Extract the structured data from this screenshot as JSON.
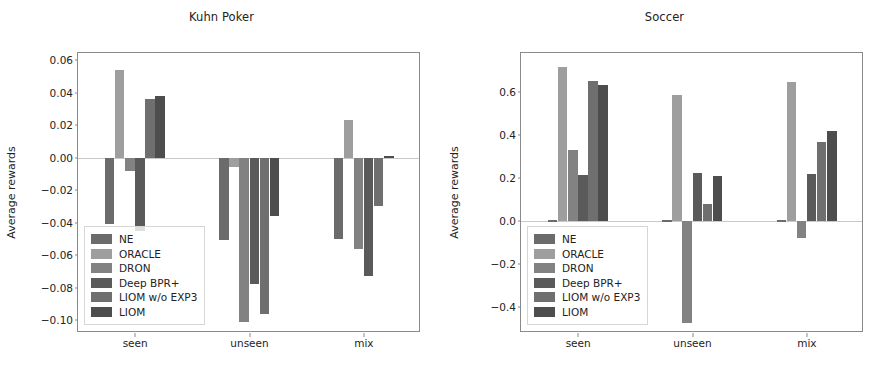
{
  "figure": {
    "panels": [
      "kuhn_poker",
      "soccer"
    ]
  },
  "series_colors": {
    "NE": "#6b6b6b",
    "ORACLE": "#9e9e9e",
    "DRON": "#828282",
    "Deep BPR+": "#5a5a5a",
    "LIOM w/o EXP3": "#6f6f6f",
    "LIOM": "#4d4d4d"
  },
  "legend": {
    "entries": [
      {
        "label": "NE",
        "color": "#6b6b6b"
      },
      {
        "label": "ORACLE",
        "color": "#9e9e9e"
      },
      {
        "label": "DRON",
        "color": "#828282"
      },
      {
        "label": "Deep BPR+",
        "color": "#5a5a5a"
      },
      {
        "label": "LIOM w/o EXP3",
        "color": "#6f6f6f"
      },
      {
        "label": "LIOM",
        "color": "#4d4d4d"
      }
    ]
  },
  "chart_data": [
    {
      "id": "kuhn_poker",
      "type": "bar",
      "title": "Kuhn Poker",
      "xlabel": "",
      "ylabel": "Average rewards",
      "categories": [
        "seen",
        "unseen",
        "mix"
      ],
      "ylim": [
        -0.108,
        0.0645
      ],
      "yticks": [
        0.06,
        0.04,
        0.02,
        0.0,
        -0.02,
        -0.04,
        -0.06,
        -0.08,
        -0.1
      ],
      "ytick_labels": [
        "0.06",
        "0.04",
        "0.02",
        "0.00",
        "−0.02",
        "−0.04",
        "−0.06",
        "−0.08",
        "−0.10"
      ],
      "grid": false,
      "legend_position": "lower left",
      "series": [
        {
          "name": "NE",
          "values": [
            -0.041,
            -0.051,
            -0.05
          ]
        },
        {
          "name": "ORACLE",
          "values": [
            0.054,
            -0.006,
            0.023
          ]
        },
        {
          "name": "DRON",
          "values": [
            -0.008,
            -0.101,
            -0.056
          ]
        },
        {
          "name": "Deep BPR+",
          "values": [
            -0.045,
            -0.078,
            -0.073
          ]
        },
        {
          "name": "LIOM w/o EXP3",
          "values": [
            0.036,
            -0.096,
            -0.03
          ]
        },
        {
          "name": "LIOM",
          "values": [
            0.038,
            -0.036,
            0.0008
          ]
        }
      ]
    },
    {
      "id": "soccer",
      "type": "bar",
      "title": "Soccer",
      "xlabel": "",
      "ylabel": "Average rewards",
      "categories": [
        "seen",
        "unseen",
        "mix"
      ],
      "ylim": [
        -0.52,
        0.78
      ],
      "yticks": [
        0.6,
        0.4,
        0.2,
        0.0,
        -0.2,
        -0.4
      ],
      "ytick_labels": [
        "0.6",
        "0.4",
        "0.2",
        "0.0",
        "−0.2",
        "−0.4"
      ],
      "grid": false,
      "legend_position": "lower left",
      "series": [
        {
          "name": "NE",
          "values": [
            0.004,
            0.004,
            0.004
          ]
        },
        {
          "name": "ORACLE",
          "values": [
            0.715,
            0.585,
            0.645
          ]
        },
        {
          "name": "DRON",
          "values": [
            0.33,
            -0.475,
            -0.078
          ]
        },
        {
          "name": "Deep BPR+",
          "values": [
            0.215,
            0.225,
            0.218
          ]
        },
        {
          "name": "LIOM w/o EXP3",
          "values": [
            0.652,
            0.078,
            0.367
          ]
        },
        {
          "name": "LIOM",
          "values": [
            0.63,
            0.21,
            0.42
          ]
        }
      ]
    }
  ]
}
